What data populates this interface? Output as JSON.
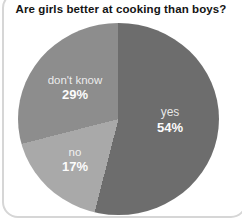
{
  "chart_data": {
    "type": "pie",
    "title": "Are girls better at cooking than boys?",
    "direction": "clockwise",
    "start_angle_deg": 0,
    "legend_position": "labels-inside-slices",
    "slices": [
      {
        "label": "yes",
        "value": 54,
        "value_label": "54%",
        "color": "#6d6d6d"
      },
      {
        "label": "no",
        "value": 17,
        "value_label": "17%",
        "color": "#a9a9a9"
      },
      {
        "label": "don't know",
        "value": 29,
        "value_label": "29%",
        "color": "#8d8d8d"
      }
    ],
    "colors": {
      "card_background": "#ffffff",
      "card_border": "#d6d6d6",
      "title_text": "#141414",
      "label_text": "#ffffff"
    }
  }
}
